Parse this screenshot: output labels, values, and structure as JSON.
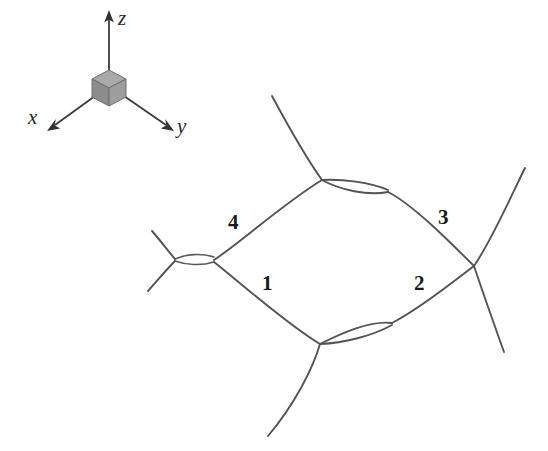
{
  "figure": {
    "background_color": "#ffffff",
    "title": "",
    "caption": ""
  },
  "axes_inset": {
    "name": "coordinate-axes-inset",
    "origin_marker": "gray-cube",
    "cube_colors": {
      "top": "#a9a9a9",
      "left": "#8c8c8c",
      "right": "#9d9d9d",
      "edge": "#6e6e6e"
    },
    "axes": [
      {
        "id": "x",
        "label": "x",
        "direction": "down-left"
      },
      {
        "id": "y",
        "label": "y",
        "direction": "down-right"
      },
      {
        "id": "z",
        "label": "z",
        "direction": "up"
      }
    ]
  },
  "network": {
    "name": "wire-network-diagram",
    "stroke_color": "#555258",
    "segment_labels": [
      {
        "id": "seg-1",
        "label": "1",
        "x": 262,
        "y": 290
      },
      {
        "id": "seg-2",
        "label": "2",
        "x": 414,
        "y": 290
      },
      {
        "id": "seg-3",
        "label": "3",
        "x": 438,
        "y": 224
      },
      {
        "id": "seg-4",
        "label": "4",
        "x": 228,
        "y": 229
      }
    ],
    "junctions": [
      {
        "id": "junction-left",
        "type": "crossing-with-lens",
        "x": 175,
        "y": 260
      },
      {
        "id": "junction-top",
        "type": "lens",
        "x": 322,
        "y": 180
      },
      {
        "id": "junction-bottom",
        "type": "lens",
        "x": 320,
        "y": 344
      },
      {
        "id": "junction-right",
        "type": "crossing",
        "x": 474,
        "y": 266
      }
    ]
  }
}
